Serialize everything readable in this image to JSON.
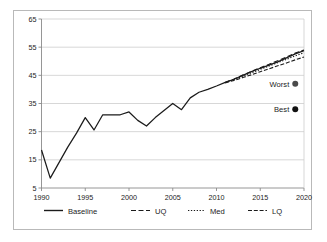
{
  "chart_data": {
    "type": "line",
    "title": "",
    "xlabel": "",
    "ylabel": "",
    "xlim": [
      1990,
      2020
    ],
    "ylim": [
      5,
      65
    ],
    "grid": true,
    "grid_axis": "y",
    "legend_position": "bottom",
    "xticks": [
      1990,
      1995,
      2000,
      2005,
      2010,
      2015,
      2020
    ],
    "xtick_labels": [
      "1990",
      "1995",
      "2000",
      "2005",
      "2010",
      "2015",
      "2020"
    ],
    "yticks": [
      5,
      15,
      25,
      35,
      45,
      55,
      65
    ],
    "ytick_labels": [
      "5",
      "15",
      "25",
      "35",
      "45",
      "55",
      "65"
    ],
    "x": [
      1990,
      1991,
      1992,
      1993,
      1994,
      1995,
      1996,
      1997,
      1998,
      1999,
      2000,
      2001,
      2002,
      2003,
      2004,
      2005,
      2006,
      2007,
      2008,
      2009,
      2010,
      2011,
      2012,
      2013,
      2014,
      2015,
      2016,
      2017,
      2018,
      2019,
      2020
    ],
    "series": [
      {
        "name": "Baseline",
        "style": "solid",
        "x": [
          1990,
          1991,
          1992,
          1993,
          1994,
          1995,
          1996,
          1997,
          1998,
          1999,
          2000,
          2001,
          2002,
          2003,
          2004,
          2005,
          2006,
          2007,
          2008,
          2009,
          2010,
          2011,
          2012,
          2013,
          2014,
          2015,
          2016,
          2017,
          2018,
          2019,
          2020
        ],
        "values": [
          18.5,
          8.5,
          14.0,
          19.5,
          24.5,
          30.0,
          25.6,
          31.0,
          31.0,
          31.0,
          32.0,
          29.0,
          27.0,
          30.0,
          32.5,
          35.0,
          32.8,
          37.0,
          39.0,
          40.0,
          41.2,
          42.5,
          43.6,
          45.0,
          46.3,
          47.5,
          48.6,
          49.8,
          51.2,
          52.6,
          53.8
        ]
      },
      {
        "name": "UQ",
        "style": "dashed",
        "x": [
          2011,
          2012,
          2013,
          2014,
          2015,
          2016,
          2017,
          2018,
          2019,
          2020
        ],
        "values": [
          42.5,
          43.7,
          45.1,
          46.4,
          47.7,
          48.9,
          50.2,
          51.5,
          52.9,
          54.0
        ]
      },
      {
        "name": "Med",
        "style": "dotted",
        "x": [
          2011,
          2012,
          2013,
          2014,
          2015,
          2016,
          2017,
          2018,
          2019,
          2020
        ],
        "values": [
          42.4,
          43.5,
          44.7,
          45.9,
          47.1,
          48.3,
          49.5,
          50.7,
          51.9,
          53.0
        ]
      },
      {
        "name": "LQ",
        "style": "dashdash",
        "x": [
          2011,
          2012,
          2013,
          2014,
          2015,
          2016,
          2017,
          2018,
          2019,
          2020
        ],
        "values": [
          42.3,
          43.2,
          44.2,
          45.2,
          46.3,
          47.3,
          48.4,
          49.4,
          50.5,
          51.5
        ]
      }
    ],
    "annotations": [
      {
        "label": "Worst",
        "x": 2019.0,
        "y": 42.0,
        "marker": "circle",
        "marker_color": "#4a4a4a"
      },
      {
        "label": "Best",
        "x": 2019.0,
        "y": 33.0,
        "marker": "circle",
        "marker_color": "#111111"
      }
    ]
  },
  "legend": {
    "items": [
      {
        "label": "Baseline",
        "style": "solid"
      },
      {
        "label": "UQ",
        "style": "dashed"
      },
      {
        "label": "Med",
        "style": "dotted"
      },
      {
        "label": "LQ",
        "style": "dashdash"
      }
    ]
  },
  "colors": {
    "line": "#1b1b1b",
    "grid": "#cdcdcd",
    "axis": "#8a8a8a",
    "frame": "#b9b9b9",
    "background": "#ffffff",
    "worst_marker": "#4a4a4a",
    "best_marker": "#111111"
  }
}
